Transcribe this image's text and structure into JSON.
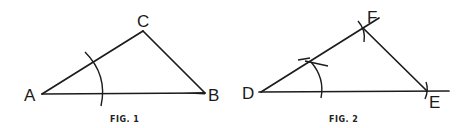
{
  "figures": [
    {
      "caption": "FIG. 1",
      "vertices": {
        "a": {
          "label": "A",
          "x": 42,
          "y": 94
        },
        "b": {
          "label": "B",
          "x": 205,
          "y": 93
        },
        "c": {
          "label": "C",
          "x": 143,
          "y": 31
        }
      },
      "segments": [
        "AB",
        "AC",
        "CB"
      ],
      "arcs": [
        {
          "center": "A",
          "description": "arc centered at A crossing AC and AB"
        }
      ]
    },
    {
      "caption": "FIG. 2",
      "vertices": {
        "d": {
          "label": "D",
          "x": 261,
          "y": 92
        },
        "e": {
          "label": "E",
          "x": 427,
          "y": 91
        },
        "f": {
          "label": "F",
          "x": 363,
          "y": 28
        }
      },
      "segments": [
        "DE",
        "DF",
        "FE"
      ],
      "arcs": [
        {
          "center": "D",
          "description": "arc centered at D crossing DF and DE"
        },
        {
          "at": "F",
          "description": "tick mark arc at F"
        },
        {
          "at": "E",
          "description": "tick mark arc at E"
        }
      ]
    }
  ]
}
